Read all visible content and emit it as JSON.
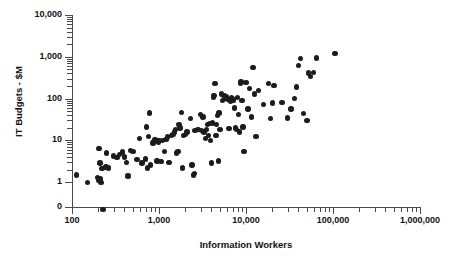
{
  "chart_data": {
    "type": "scatter",
    "title": "",
    "xlabel": "Information Workers",
    "ylabel": "IT Budgets - $M",
    "xscale": "log",
    "yscale": "log",
    "xlim": [
      100,
      1000000
    ],
    "ylim": [
      0.2,
      10000
    ],
    "grid": false,
    "legend": null,
    "x_ticks": [
      "100",
      "1,000",
      "10,000",
      "100,000",
      "1,000,000"
    ],
    "x_tick_values": [
      100,
      1000,
      10000,
      100000,
      1000000
    ],
    "y_ticks": [
      "10,000",
      "1,000",
      "100",
      "10",
      "1",
      "0"
    ],
    "y_tick_values": [
      10000,
      1000,
      100,
      10,
      1,
      0
    ],
    "marker": {
      "shape": "circle",
      "color": "#1c1c1c",
      "size": 5
    },
    "n_points": 130,
    "points": [
      [
        112,
        1.5
      ],
      [
        150,
        1.0
      ],
      [
        196,
        1.3
      ],
      [
        200,
        1.1
      ],
      [
        203,
        6.4
      ],
      [
        208,
        6.5
      ],
      [
        210,
        2.9
      ],
      [
        212,
        1.2
      ],
      [
        215,
        1.0
      ],
      [
        222,
        2.1
      ],
      [
        228,
        0.22
      ],
      [
        245,
        2.3
      ],
      [
        250,
        5.0
      ],
      [
        262,
        2.2
      ],
      [
        300,
        4.2
      ],
      [
        330,
        3.9
      ],
      [
        350,
        4.6
      ],
      [
        380,
        5.3
      ],
      [
        400,
        4.0
      ],
      [
        420,
        3.0
      ],
      [
        440,
        1.4
      ],
      [
        470,
        5.8
      ],
      [
        500,
        5.5
      ],
      [
        560,
        3.5
      ],
      [
        600,
        11.0
      ],
      [
        640,
        2.9
      ],
      [
        700,
        3.6
      ],
      [
        720,
        21.0
      ],
      [
        740,
        2.2
      ],
      [
        760,
        12.5
      ],
      [
        780,
        45.0
      ],
      [
        800,
        2.6
      ],
      [
        850,
        8.6
      ],
      [
        880,
        9.5
      ],
      [
        900,
        10.5
      ],
      [
        950,
        3.2
      ],
      [
        980,
        9.0
      ],
      [
        1000,
        10.0
      ],
      [
        1050,
        3.1
      ],
      [
        1100,
        9.8
      ],
      [
        1150,
        5.5
      ],
      [
        1200,
        10.5
      ],
      [
        1250,
        12.0
      ],
      [
        1300,
        3.0
      ],
      [
        1400,
        13.0
      ],
      [
        1450,
        14.0
      ],
      [
        1500,
        16.0
      ],
      [
        1550,
        18.0
      ],
      [
        1600,
        5.0
      ],
      [
        1650,
        5.5
      ],
      [
        1700,
        24.0
      ],
      [
        1750,
        20.0
      ],
      [
        1800,
        46.0
      ],
      [
        1850,
        2.2
      ],
      [
        1900,
        13.0
      ],
      [
        2000,
        14.0
      ],
      [
        2100,
        16.0
      ],
      [
        2300,
        33.0
      ],
      [
        2400,
        2.6
      ],
      [
        2500,
        1.5
      ],
      [
        2550,
        1.6
      ],
      [
        2600,
        17.0
      ],
      [
        2800,
        18.0
      ],
      [
        3000,
        42.0
      ],
      [
        3100,
        17.5
      ],
      [
        3200,
        36.0
      ],
      [
        3300,
        16.0
      ],
      [
        3400,
        11.0
      ],
      [
        3500,
        18.0
      ],
      [
        3600,
        24.0
      ],
      [
        3700,
        13.0
      ],
      [
        3800,
        25.0
      ],
      [
        3900,
        10.0
      ],
      [
        4000,
        2.9
      ],
      [
        4100,
        26.0
      ],
      [
        4200,
        105.0
      ],
      [
        4300,
        120.0
      ],
      [
        4400,
        230.0
      ],
      [
        4500,
        13.0
      ],
      [
        4600,
        24.0
      ],
      [
        4700,
        40.0
      ],
      [
        4800,
        3.2
      ],
      [
        4900,
        45.0
      ],
      [
        5000,
        18.0
      ],
      [
        5200,
        130.0
      ],
      [
        5400,
        90.0
      ],
      [
        5600,
        120.0
      ],
      [
        5800,
        100.0
      ],
      [
        6000,
        110.0
      ],
      [
        6200,
        95.0
      ],
      [
        6400,
        19.0
      ],
      [
        6600,
        88.0
      ],
      [
        6800,
        105.0
      ],
      [
        7000,
        100.0
      ],
      [
        7200,
        92.0
      ],
      [
        7400,
        60.0
      ],
      [
        7600,
        20.0
      ],
      [
        7800,
        18.0
      ],
      [
        8000,
        105.0
      ],
      [
        8200,
        42.0
      ],
      [
        8400,
        16.0
      ],
      [
        8600,
        230.0
      ],
      [
        8800,
        250.0
      ],
      [
        9000,
        90.0
      ],
      [
        9200,
        21.0
      ],
      [
        9500,
        5.5
      ],
      [
        10000,
        240.0
      ],
      [
        10500,
        57.0
      ],
      [
        11000,
        175.0
      ],
      [
        11500,
        36.0
      ],
      [
        12000,
        550.0
      ],
      [
        12500,
        130.0
      ],
      [
        13000,
        12.5
      ],
      [
        14000,
        155.0
      ],
      [
        16000,
        72.0
      ],
      [
        18000,
        230.0
      ],
      [
        19000,
        33.0
      ],
      [
        20000,
        78.0
      ],
      [
        21000,
        205.0
      ],
      [
        26000,
        80.0
      ],
      [
        30000,
        34.0
      ],
      [
        33000,
        56.0
      ],
      [
        36000,
        100.0
      ],
      [
        38000,
        190.0
      ],
      [
        40000,
        620.0
      ],
      [
        42000,
        900.0
      ],
      [
        46000,
        44.0
      ],
      [
        50000,
        30.0
      ],
      [
        52000,
        410.0
      ],
      [
        55000,
        340.0
      ],
      [
        60000,
        420.0
      ],
      [
        65000,
        930.0
      ],
      [
        105000,
        1180.0
      ]
    ]
  }
}
